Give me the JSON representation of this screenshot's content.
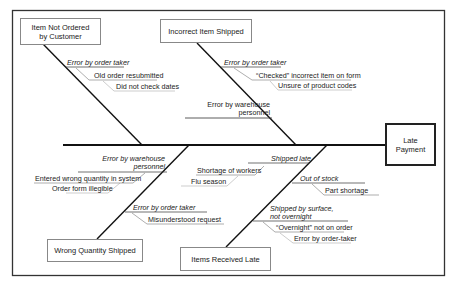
{
  "diagram": {
    "type": "fishbone",
    "effect": {
      "label_line1": "Late",
      "label_line2": "Payment"
    },
    "categories": [
      {
        "id": "item-not-ordered",
        "label_line1": "Item Not Ordered",
        "label_line2": "by Customer",
        "causes": [
          {
            "label": "Error by order taker",
            "sub_causes": [
              "Old order resubmitted",
              "Did not check dates"
            ]
          }
        ]
      },
      {
        "id": "incorrect-item-shipped",
        "label": "Incorrect Item Shipped",
        "causes": [
          {
            "label": "Error by order taker",
            "sub_causes": [
              "“Checked” incorrect item on form",
              "Unsure of product codes"
            ]
          },
          {
            "label_line1": "Error by warehouse",
            "label_line2": "personnel",
            "sub_causes": []
          }
        ]
      },
      {
        "id": "wrong-quantity-shipped",
        "label": "Wrong Quantity Shipped",
        "causes": [
          {
            "label_line1": "Error by warehouse",
            "label_line2": "personnel",
            "sub_causes": [
              "Entered wrong quantity in system",
              "Order form illegible"
            ]
          },
          {
            "label": "Error by order taker",
            "sub_causes": [
              "Misunderstood request"
            ]
          }
        ]
      },
      {
        "id": "items-received-late",
        "label": "Items Received Late",
        "causes": [
          {
            "label": "Shipped late",
            "sub_causes": [
              "Shortage of workers",
              "Flu season"
            ]
          },
          {
            "label": "Out of stock",
            "sub_causes": [
              "Part shortage"
            ]
          },
          {
            "label_line1": "Shipped by surface,",
            "label_line2": "not overnight",
            "sub_causes": [
              "“Overnight” not on order",
              "Error by order-taker"
            ]
          }
        ]
      }
    ]
  }
}
